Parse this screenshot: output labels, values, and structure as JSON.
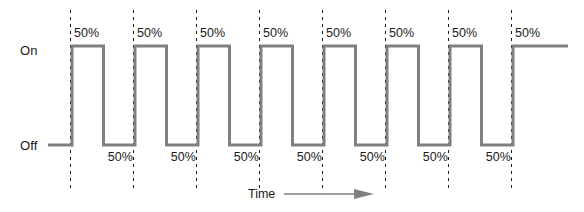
{
  "figure": {
    "width": 584,
    "height": 212,
    "background_color": "#ffffff",
    "type": "pwm-square-wave-timing-diagram"
  },
  "axis": {
    "y_high_label": "On",
    "y_low_label": "Off",
    "x_label": "Time",
    "x_arrow_icon": "right-arrow-icon"
  },
  "style": {
    "waveform_color": "#808080",
    "waveform_width": 3,
    "marker_color": "#1a1a1a",
    "text_color": "#1a1a1a",
    "marker_dash": "3,4"
  },
  "geometry": {
    "high_y": 46,
    "low_y": 145,
    "trace_start_x": 48,
    "trace_end_x": 568,
    "first_edge_x": 72,
    "period_px": 63,
    "half_period_px": 31.5,
    "pulse_count": 8,
    "marker_top_y": 10,
    "marker_bottom_y": 190
  },
  "duty_labels_high": [
    {
      "text": "50%",
      "x": 74,
      "y": 26
    },
    {
      "text": "50%",
      "x": 137,
      "y": 26
    },
    {
      "text": "50%",
      "x": 200,
      "y": 26
    },
    {
      "text": "50%",
      "x": 263,
      "y": 26
    },
    {
      "text": "50%",
      "x": 326,
      "y": 26
    },
    {
      "text": "50%",
      "x": 389,
      "y": 26
    },
    {
      "text": "50%",
      "x": 452,
      "y": 26
    },
    {
      "text": "50%",
      "x": 515,
      "y": 26
    }
  ],
  "duty_labels_low": [
    {
      "text": "50%",
      "right_x": 133,
      "y": 150
    },
    {
      "text": "50%",
      "right_x": 196,
      "y": 150
    },
    {
      "text": "50%",
      "right_x": 259,
      "y": 150
    },
    {
      "text": "50%",
      "right_x": 322,
      "y": 150
    },
    {
      "text": "50%",
      "right_x": 385,
      "y": 150
    },
    {
      "text": "50%",
      "right_x": 448,
      "y": 150
    },
    {
      "text": "50%",
      "right_x": 511,
      "y": 150
    }
  ],
  "chart_data": {
    "type": "line",
    "title": "",
    "xlabel": "Time",
    "ylabel": "",
    "grid": false,
    "legend": null,
    "y_tick_labels": [
      "On",
      "Off"
    ],
    "duty_cycle_percent": 50,
    "pulse_count": 8,
    "series": [
      {
        "name": "PWM output",
        "states": [
          {
            "level": "Off",
            "duty_percent": 50
          },
          {
            "level": "On",
            "duty_percent": 50
          },
          {
            "level": "Off",
            "duty_percent": 50
          },
          {
            "level": "On",
            "duty_percent": 50
          },
          {
            "level": "Off",
            "duty_percent": 50
          },
          {
            "level": "On",
            "duty_percent": 50
          },
          {
            "level": "Off",
            "duty_percent": 50
          },
          {
            "level": "On",
            "duty_percent": 50
          },
          {
            "level": "Off",
            "duty_percent": 50
          },
          {
            "level": "On",
            "duty_percent": 50
          },
          {
            "level": "Off",
            "duty_percent": 50
          },
          {
            "level": "On",
            "duty_percent": 50
          },
          {
            "level": "Off",
            "duty_percent": 50
          },
          {
            "level": "On",
            "duty_percent": 50
          },
          {
            "level": "Off",
            "duty_percent": 50
          },
          {
            "level": "On",
            "duty_percent": 50
          }
        ]
      }
    ],
    "annotations_high": [
      "50%",
      "50%",
      "50%",
      "50%",
      "50%",
      "50%",
      "50%",
      "50%"
    ],
    "annotations_low": [
      "50%",
      "50%",
      "50%",
      "50%",
      "50%",
      "50%",
      "50%"
    ]
  }
}
